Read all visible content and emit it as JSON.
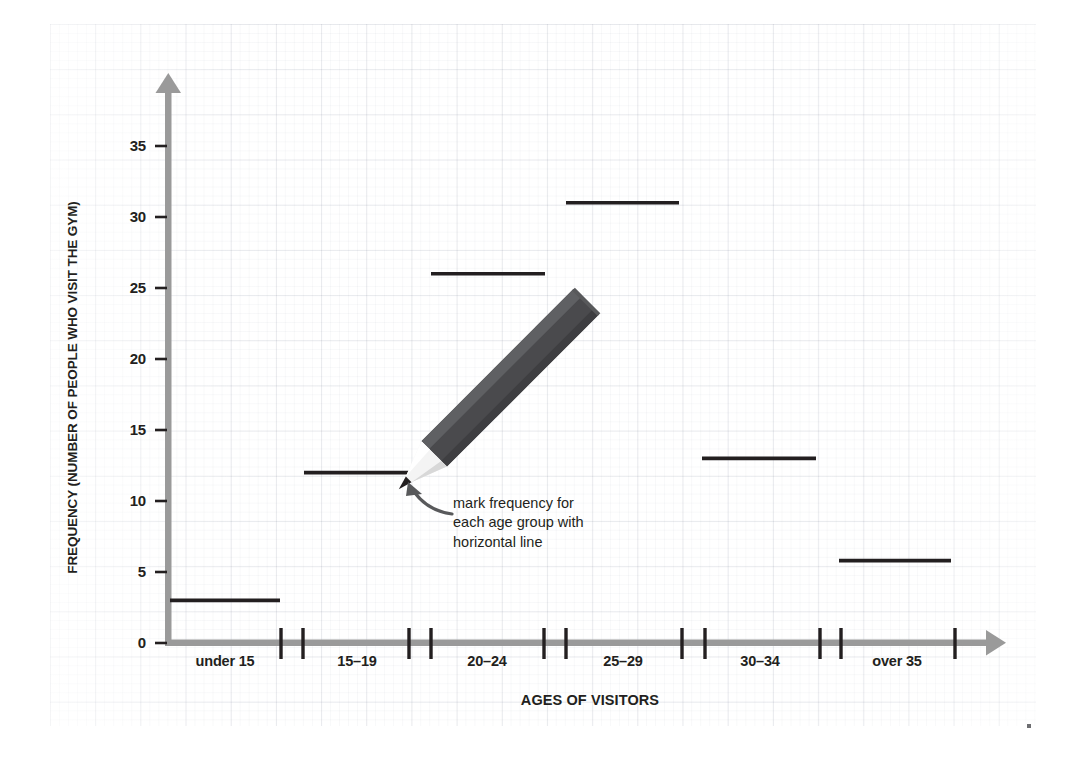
{
  "chart_data": {
    "type": "bar",
    "title": "",
    "subtitle": "",
    "xlabel": "AGES OF VISITORS",
    "ylabel": "FREQUENCY (NUMBER OF PEOPLE WHO VISIT THE GYM)",
    "categories": [
      "under 15",
      "15–19",
      "20–24",
      "25–29",
      "30–34",
      "over 35"
    ],
    "values": [
      3,
      12,
      26,
      31,
      13,
      5.8
    ],
    "ylim": [
      0,
      38
    ],
    "ytick_labels": [
      "0",
      "5",
      "10",
      "15",
      "20",
      "25",
      "30",
      "35"
    ],
    "ytick_values": [
      0,
      5,
      10,
      15,
      20,
      25,
      30,
      35
    ],
    "grid": true,
    "legend": null,
    "style": "hand-drawn worksheet, frequency marked with short horizontal line per age group",
    "annotations": [
      {
        "text_lines": [
          "mark frequency for",
          "each age group with",
          "horizontal line"
        ],
        "points_to_category": "15–19"
      }
    ],
    "colors": {
      "axis": "#9a9a9a",
      "data_line": "#231f20",
      "text": "#231f20",
      "grid": "#c9cfdb",
      "pencil_body": "#4a4a4d",
      "pencil_body_light": "#5f6063",
      "pencil_tip": "#f2f2f2",
      "pencil_lead": "#231f20",
      "annotation_arrow": "#58595b",
      "background": "#ffffff"
    }
  },
  "annotation": {
    "line1": "mark frequency for",
    "line2": "each age group with",
    "line3": "horizontal line"
  },
  "axes": {
    "x_title": "AGES OF VISITORS",
    "y_title": "FREQUENCY (NUMBER OF PEOPLE WHO VISIT THE GYM)"
  },
  "yticks": {
    "t0": "0",
    "t5": "5",
    "t10": "10",
    "t15": "15",
    "t20": "20",
    "t25": "25",
    "t30": "30",
    "t35": "35"
  },
  "xticks": {
    "c0": "under 15",
    "c1": "15–19",
    "c2": "20–24",
    "c3": "25–29",
    "c4": "30–34",
    "c5": "over 35"
  },
  "icons": {
    "pencil": "pencil-icon",
    "arrow": "curved-arrow-icon"
  }
}
